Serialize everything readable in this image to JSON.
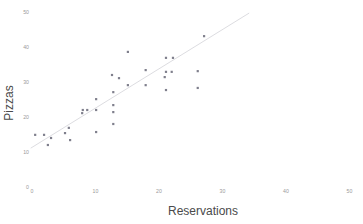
{
  "chart_data": {
    "type": "scatter",
    "title": "",
    "xlabel": "Reservations",
    "ylabel": "Pizzas",
    "xlim": [
      0,
      52
    ],
    "ylim": [
      0,
      52
    ],
    "xticks": [
      0,
      10,
      20,
      30,
      40,
      50
    ],
    "yticks": [
      0,
      10,
      20,
      30,
      40,
      50
    ],
    "xtick_labels": [
      "0",
      "10",
      "20",
      "30",
      "40",
      "50"
    ],
    "ytick_labels": [
      "0",
      "10",
      "20",
      "30",
      "40",
      "50"
    ],
    "grid": false,
    "legend": false,
    "point_color": "#7f7f8c",
    "line_color": "#d8d8dc",
    "tick_label_color": "#9a9a9a",
    "axis_title_color": "#4a4a4a",
    "background_color": "#ffffff",
    "points": [
      {
        "x": 0.5,
        "y": 14.9
      },
      {
        "x": 1.9,
        "y": 14.9
      },
      {
        "x": 2.5,
        "y": 12.0
      },
      {
        "x": 3.0,
        "y": 14.0
      },
      {
        "x": 5.2,
        "y": 15.4
      },
      {
        "x": 5.8,
        "y": 16.9
      },
      {
        "x": 6.0,
        "y": 13.4
      },
      {
        "x": 7.9,
        "y": 21.1
      },
      {
        "x": 8.7,
        "y": 22.0
      },
      {
        "x": 10.1,
        "y": 25.1
      },
      {
        "x": 10.1,
        "y": 22.0
      },
      {
        "x": 10.1,
        "y": 15.7
      },
      {
        "x": 8.0,
        "y": 22.0
      },
      {
        "x": 12.8,
        "y": 27.1
      },
      {
        "x": 12.8,
        "y": 23.4
      },
      {
        "x": 12.8,
        "y": 21.4
      },
      {
        "x": 12.8,
        "y": 18.0
      },
      {
        "x": 15.1,
        "y": 38.6
      },
      {
        "x": 17.9,
        "y": 33.4
      },
      {
        "x": 21.1,
        "y": 32.9
      },
      {
        "x": 22.0,
        "y": 32.9
      },
      {
        "x": 12.6,
        "y": 32.0
      },
      {
        "x": 13.7,
        "y": 31.1
      },
      {
        "x": 15.1,
        "y": 29.1
      },
      {
        "x": 17.9,
        "y": 29.1
      },
      {
        "x": 21.1,
        "y": 27.7
      },
      {
        "x": 27.1,
        "y": 43.1
      },
      {
        "x": 21.1,
        "y": 36.9
      },
      {
        "x": 22.2,
        "y": 36.9
      },
      {
        "x": 26.1,
        "y": 33.1
      },
      {
        "x": 20.9,
        "y": 31.4
      },
      {
        "x": 26.1,
        "y": 28.3
      }
    ],
    "fit_line": {
      "x_start": -0.2,
      "y_start": 11.1,
      "x_end": 34.2,
      "y_end": 49.7
    }
  },
  "axes": {
    "x_title": "Reservations",
    "y_title": "Pizzas"
  }
}
